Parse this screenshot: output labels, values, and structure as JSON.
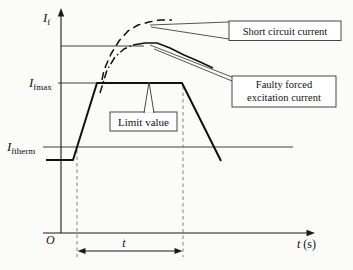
{
  "figure": {
    "colors": {
      "ink": "#1a1a1a",
      "muted_dash": "#808080",
      "background": "#fbfbf9",
      "box_fill": "#ffffff"
    },
    "labels": {
      "y_axis_main": "I",
      "y_axis_sub": "f",
      "ifmax_main": "I",
      "ifmax_sub": "fmax",
      "iftherm_main": "I",
      "iftherm_sub": "ftherm",
      "origin": "O",
      "x_axis_main": "t",
      "x_axis_unit": " (s)",
      "t_interval": "t"
    },
    "callouts": {
      "short_circuit": "Short circuit current",
      "faulty_line1": "Faulty forced",
      "faulty_line2": "excitation current",
      "limit": "Limit value"
    }
  },
  "chart_data": {
    "type": "line",
    "title": "",
    "xlabel": "t (s)",
    "ylabel": "If",
    "axes_numeric": false,
    "grid": false,
    "y_reference_levels": [
      "Ifmax",
      "Iftherm"
    ],
    "x_interval": {
      "label": "t",
      "marked_between": "dashed verticals at fault start and limit end"
    },
    "series": [
      {
        "name": "Short circuit current",
        "style": "dashed",
        "shape": "steep rise then high plateau"
      },
      {
        "name": "Faulty forced excitation current",
        "style": "dash-dot rise, solid fall",
        "shape": "rise, peak above Ifmax, gentle decline"
      },
      {
        "name": "Limit value",
        "style": "solid thick",
        "shape": "flat below Iftherm, ramp up to Ifmax, flat, ramp down"
      }
    ],
    "paths": {
      "y_axis": [
        [
          61,
          233
        ],
        [
          61,
          13
        ]
      ],
      "x_axis": [
        [
          43,
          233
        ],
        [
          310,
          233
        ]
      ],
      "ref_peak": [
        [
          61,
          46
        ],
        [
          144,
          46
        ]
      ],
      "ref_ifmax": [
        [
          58,
          83
        ],
        [
          98,
          83
        ]
      ],
      "ref_iftherm": [
        [
          43,
          147
        ],
        [
          293,
          147
        ]
      ],
      "limit_curve": [
        [
          46,
          160
        ],
        [
          73,
          160
        ],
        [
          97,
          83
        ],
        [
          182,
          83
        ],
        [
          221,
          161
        ]
      ],
      "short_circuit": [
        [
          102,
          80
        ],
        [
          104,
          70
        ],
        [
          111,
          54
        ],
        [
          119,
          41
        ],
        [
          128,
          31
        ],
        [
          138,
          25
        ],
        [
          149,
          22
        ],
        [
          160,
          20
        ],
        [
          172,
          20
        ]
      ],
      "faulty_rise": [
        [
          100,
          93
        ],
        [
          107,
          70
        ],
        [
          115,
          57
        ],
        [
          124,
          49
        ],
        [
          133,
          45
        ]
      ],
      "faulty_fall": [
        [
          133,
          45
        ],
        [
          145,
          43
        ],
        [
          157,
          43
        ],
        [
          170,
          48
        ],
        [
          184,
          55
        ],
        [
          198,
          61
        ],
        [
          213,
          68
        ]
      ],
      "vguide_left": [
        [
          77,
          150
        ],
        [
          77,
          257
        ]
      ],
      "vguide_right": [
        [
          183,
          86
        ],
        [
          183,
          257
        ]
      ],
      "dim_line": [
        [
          82,
          251
        ],
        [
          178,
          251
        ]
      ],
      "wedge_short_a": [
        [
          150,
          25
        ],
        [
          229,
          22
        ]
      ],
      "wedge_short_b": [
        [
          151,
          27
        ],
        [
          229,
          39
        ]
      ],
      "wedge_faulty_a": [
        [
          150,
          45
        ],
        [
          232,
          77
        ]
      ],
      "wedge_faulty_b": [
        [
          154,
          49
        ],
        [
          232,
          81
        ]
      ],
      "flag_fill": [
        [
          149,
          84
        ],
        [
          153.5,
          112.8
        ],
        [
          144.5,
          112.8
        ]
      ],
      "flag_side_l": [
        [
          149,
          82
        ],
        [
          144,
          113
        ]
      ],
      "flag_side_r": [
        [
          149,
          82
        ],
        [
          154,
          113
        ]
      ]
    },
    "boxes": {
      "short": {
        "x": 229,
        "y": 21,
        "w": 112,
        "h": 19.5
      },
      "faulty": {
        "x": 232,
        "y": 76,
        "w": 104,
        "h": 31
      },
      "limit": {
        "x": 110,
        "y": 112,
        "w": 67,
        "h": 19
      }
    }
  }
}
